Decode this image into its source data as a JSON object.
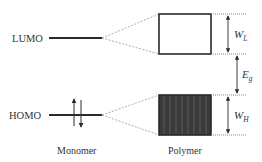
{
  "diagram": {
    "type": "energy-level-diagram",
    "levels": {
      "lumo_label": "LUMO",
      "homo_label": "HOMO"
    },
    "columns": {
      "monomer_label": "Monomer",
      "polymer_label": "Polymer"
    },
    "dimensions": {
      "lumo_width": {
        "symbol": "W",
        "subscript": "L"
      },
      "band_gap": {
        "symbol": "E",
        "subscript": "g"
      },
      "homo_width": {
        "symbol": "W",
        "subscript": "H"
      }
    },
    "colors": {
      "line": "#2a2a2a",
      "filled_band": "#3a3a3a",
      "stripe": "#555555",
      "dotted": "#888888",
      "text": "#333333"
    }
  }
}
